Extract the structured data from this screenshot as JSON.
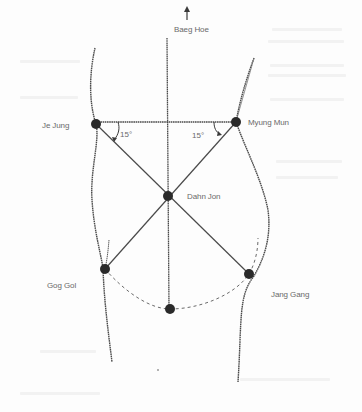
{
  "figure": {
    "direction_arrow": "up-arrow",
    "labels": {
      "top": "Baeg Hoe",
      "upper_left": "Je Jung",
      "upper_right": "Myung Mun",
      "center": "Dahn Jon",
      "lower_left": "Gog Gol",
      "lower_right": "Jang Gang"
    },
    "angles": {
      "left": "15°",
      "right": "15°"
    },
    "points": [
      {
        "name": "Je Jung",
        "x": 96,
        "y": 124
      },
      {
        "name": "Myung Mun",
        "x": 236,
        "y": 122
      },
      {
        "name": "Dahn Jon",
        "x": 168,
        "y": 196
      },
      {
        "name": "Gog Gol",
        "x": 105,
        "y": 269
      },
      {
        "name": "Jang Gang",
        "x": 249,
        "y": 274
      },
      {
        "name": "bottom",
        "x": 170,
        "y": 309
      }
    ],
    "colors": {
      "line": "#4a4a4a",
      "node": "#2a2a2a",
      "text": "#6a6a6a",
      "background": "#fdfdfd"
    }
  }
}
